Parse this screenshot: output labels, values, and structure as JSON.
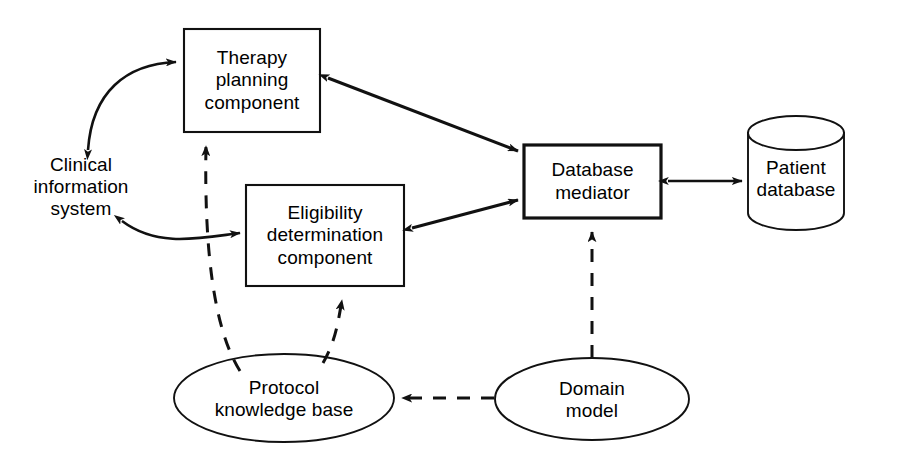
{
  "diagram": {
    "stroke_color": "#111111",
    "fill_color": "#ffffff",
    "nodes": [
      {
        "id": "therapy-planning-component",
        "label": "Therapy\nplanning\ncomponent",
        "shape": "rectangle"
      },
      {
        "id": "clinical-information-system",
        "label": "Clinical\ninformation\nsystem",
        "shape": "text"
      },
      {
        "id": "eligibility-determination-component",
        "label": "Eligibility\ndetermination\ncomponent",
        "shape": "rectangle"
      },
      {
        "id": "database-mediator",
        "label": "Database\nmediator",
        "shape": "rectangle-bold"
      },
      {
        "id": "patient-database",
        "label": "Patient\ndatabase",
        "shape": "cylinder"
      },
      {
        "id": "protocol-knowledge-base",
        "label": "Protocol\nknowledge base",
        "shape": "ellipse"
      },
      {
        "id": "domain-model",
        "label": "Domain\nmodel",
        "shape": "ellipse"
      }
    ],
    "edges": [
      {
        "id": "cis-therapy",
        "from": "clinical-information-system",
        "to": "therapy-planning-component",
        "style": "solid",
        "arrows": "both",
        "curved": true
      },
      {
        "id": "therapy-mediator",
        "from": "therapy-planning-component",
        "to": "database-mediator",
        "style": "solid",
        "arrows": "both",
        "curved": false
      },
      {
        "id": "cis-eligibility",
        "from": "clinical-information-system",
        "to": "eligibility-determination-component",
        "style": "solid",
        "arrows": "both",
        "curved": true
      },
      {
        "id": "eligibility-mediator",
        "from": "eligibility-determination-component",
        "to": "database-mediator",
        "style": "solid",
        "arrows": "both",
        "curved": false
      },
      {
        "id": "mediator-patientdb",
        "from": "database-mediator",
        "to": "patient-database",
        "style": "solid",
        "arrows": "both",
        "curved": false
      },
      {
        "id": "pkb-therapy",
        "from": "protocol-knowledge-base",
        "to": "therapy-planning-component",
        "style": "dashed",
        "arrows": "end",
        "curved": true
      },
      {
        "id": "pkb-eligibility",
        "from": "protocol-knowledge-base",
        "to": "eligibility-determination-component",
        "style": "dashed",
        "arrows": "end",
        "curved": true
      },
      {
        "id": "domain-mediator",
        "from": "domain-model",
        "to": "database-mediator",
        "style": "dashed",
        "arrows": "end",
        "curved": false
      },
      {
        "id": "domain-pkb",
        "from": "domain-model",
        "to": "protocol-knowledge-base",
        "style": "dashed",
        "arrows": "end",
        "curved": false
      }
    ]
  }
}
